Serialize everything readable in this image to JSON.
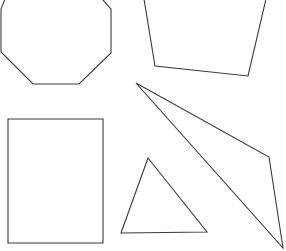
{
  "canvas": {
    "width": 286,
    "height": 251,
    "background": "#ffffff",
    "stroke": "#3a3a3a"
  },
  "shapes": [
    {
      "name": "octagon",
      "points": "5,-1 1,9 1,52 33,84 79,84 111,53 111,9 102,-1"
    },
    {
      "name": "quadrilateral",
      "points": "144,-1 155,66 248,76 266,-1"
    },
    {
      "name": "obtuse-triangle",
      "points": "136,83 269,157 283,248"
    },
    {
      "name": "small-triangle",
      "points": "148,158 121,233 207,232"
    },
    {
      "name": "rectangle",
      "points": "8,119 103,119 103,243 8,243"
    }
  ]
}
